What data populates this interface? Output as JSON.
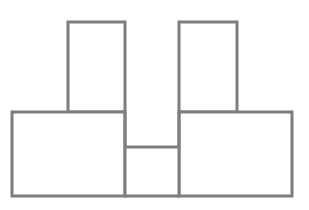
{
  "figure": {
    "canvas": {
      "width": 309,
      "height": 210,
      "background_color": "#ffffff"
    },
    "style": {
      "stroke_color": "#7e7e7e",
      "stroke_width": 3,
      "fill_color": "#ffffff"
    },
    "shapes": [
      {
        "name": "upper-left-rectangle",
        "label": "Upper left tower",
        "x": 68,
        "y": 22,
        "width": 57,
        "height": 90
      },
      {
        "name": "upper-right-rectangle",
        "label": "Upper right tower",
        "x": 179,
        "y": 22,
        "width": 58,
        "height": 90
      },
      {
        "name": "lower-left-rectangle",
        "label": "Lower left base block",
        "x": 12,
        "y": 112,
        "width": 113,
        "height": 84
      },
      {
        "name": "lower-right-rectangle",
        "label": "Lower right base block",
        "x": 179,
        "y": 112,
        "width": 113,
        "height": 84
      },
      {
        "name": "center-bottom-rectangle",
        "label": "Center bottom gate block",
        "x": 125,
        "y": 147,
        "width": 54,
        "height": 49
      }
    ],
    "segments": [
      {
        "name": "center-vertical-left-segment",
        "label": "Left inner vertical from upper tower base to gate",
        "x1": 125,
        "y1": 112,
        "x2": 125,
        "y2": 147
      },
      {
        "name": "center-vertical-right-segment",
        "label": "Right inner vertical from upper tower base to gate",
        "x1": 179,
        "y1": 112,
        "x2": 179,
        "y2": 147
      }
    ]
  }
}
